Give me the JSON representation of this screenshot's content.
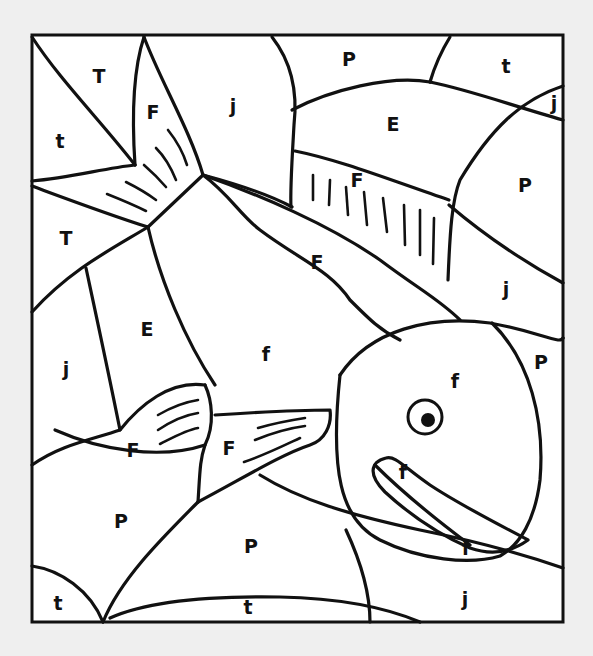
{
  "colors": {
    "background": "#efefef",
    "paper": "#ffffff",
    "line": "#111111"
  },
  "regions": [
    {
      "id": "r1",
      "label": "T",
      "x": 99,
      "y": 77
    },
    {
      "id": "r2",
      "label": "t",
      "x": 60,
      "y": 142
    },
    {
      "id": "r3",
      "label": "F",
      "x": 153,
      "y": 113
    },
    {
      "id": "r4",
      "label": "j",
      "x": 233,
      "y": 107
    },
    {
      "id": "r5",
      "label": "P",
      "x": 349,
      "y": 60
    },
    {
      "id": "r6",
      "label": "t",
      "x": 506,
      "y": 67
    },
    {
      "id": "r7",
      "label": "j",
      "x": 554,
      "y": 104
    },
    {
      "id": "r8",
      "label": "E",
      "x": 393,
      "y": 125
    },
    {
      "id": "r9",
      "label": "F",
      "x": 357,
      "y": 181
    },
    {
      "id": "r10",
      "label": "P",
      "x": 525,
      "y": 186
    },
    {
      "id": "r11",
      "label": "T",
      "x": 66,
      "y": 239
    },
    {
      "id": "r12",
      "label": "F",
      "x": 317,
      "y": 263
    },
    {
      "id": "r13",
      "label": "j",
      "x": 506,
      "y": 290
    },
    {
      "id": "r14",
      "label": "E",
      "x": 147,
      "y": 330
    },
    {
      "id": "r15",
      "label": "j",
      "x": 66,
      "y": 370
    },
    {
      "id": "r16",
      "label": "f",
      "x": 266,
      "y": 355
    },
    {
      "id": "r17",
      "label": "P",
      "x": 541,
      "y": 363
    },
    {
      "id": "r18",
      "label": "f",
      "x": 455,
      "y": 382
    },
    {
      "id": "r19",
      "label": "F",
      "x": 133,
      "y": 451
    },
    {
      "id": "r20",
      "label": "F",
      "x": 229,
      "y": 449
    },
    {
      "id": "r21",
      "label": "f",
      "x": 403,
      "y": 473
    },
    {
      "id": "r22",
      "label": "P",
      "x": 121,
      "y": 522
    },
    {
      "id": "r23",
      "label": "P",
      "x": 251,
      "y": 547
    },
    {
      "id": "r24",
      "label": "f",
      "x": 466,
      "y": 549
    },
    {
      "id": "r25",
      "label": "j",
      "x": 465,
      "y": 600
    },
    {
      "id": "r26",
      "label": "t",
      "x": 58,
      "y": 604
    },
    {
      "id": "r27",
      "label": "t",
      "x": 248,
      "y": 608
    }
  ]
}
